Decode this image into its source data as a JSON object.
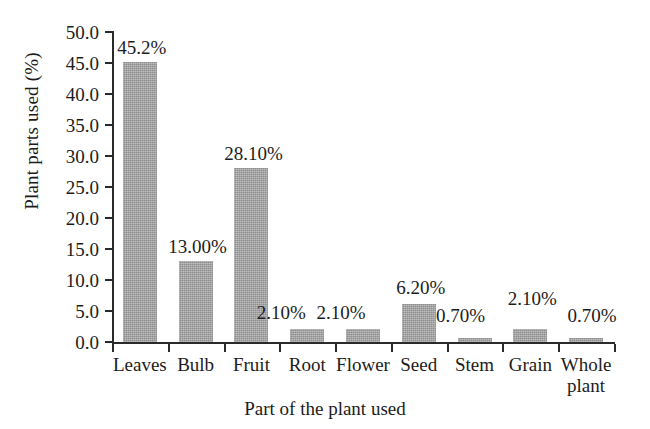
{
  "chart_data": {
    "type": "bar",
    "title": "",
    "xlabel": "Part of the plant used",
    "ylabel": "Plant parts used (%)",
    "categories": [
      "Leaves",
      "Bulb",
      "Fruit",
      "Root",
      "Flower",
      "Seed",
      "Stem",
      "Grain",
      "Whole plant"
    ],
    "values": [
      45.2,
      13.0,
      28.1,
      2.1,
      2.1,
      6.2,
      0.7,
      2.1,
      0.7
    ],
    "data_labels": [
      "45.2%",
      "13.00%",
      "28.10%",
      "2.10%",
      "2.10%",
      "6.20%",
      "0.70%",
      "2.10%",
      "0.70%"
    ],
    "ylim": [
      0.0,
      50.0
    ],
    "ytick_step": 5.0,
    "ytick_labels": [
      "50.0",
      "45.0",
      "40.0",
      "35.0",
      "30.0",
      "25.0",
      "20.0",
      "15.0",
      "10.0",
      "5.0",
      "0.0"
    ],
    "grid": false,
    "legend": false,
    "legend_position": "none",
    "bar_color": "#a3a3a3",
    "axis_color": "#2a2a2a",
    "background_color": "#ffffff"
  }
}
